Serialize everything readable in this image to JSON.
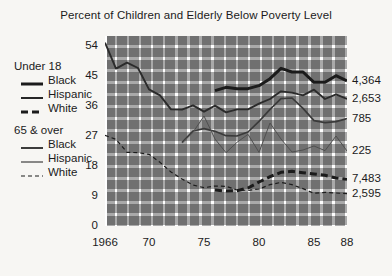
{
  "chart_data": {
    "type": "line",
    "title": "Percent of Children and Elderly Below Poverty Level",
    "xlabel": "",
    "ylabel": "",
    "xlim": [
      1966,
      1988
    ],
    "ylim": [
      0,
      57
    ],
    "yticks": [
      "0",
      "9",
      "18",
      "27",
      "36",
      "45",
      "54"
    ],
    "ytick_values": [
      0,
      9,
      18,
      27,
      36,
      45,
      54
    ],
    "xticks": [
      "1966",
      "70",
      "75",
      "80",
      "85",
      "88"
    ],
    "xtick_values": [
      1966,
      1970,
      1975,
      1980,
      1985,
      1988
    ],
    "grid": true,
    "grid_style": "checkered-gray-blocks",
    "legend_position": "left-outside",
    "series": [
      {
        "name": "Under 18 Black",
        "group": "Under 18",
        "race": "Black",
        "style": "thick-solid",
        "color": "#1b1b1b",
        "end_label": "4,364",
        "x": [
          1976,
          1977,
          1978,
          1979,
          1980,
          1981,
          1982,
          1983,
          1984,
          1985,
          1986,
          1987,
          1988
        ],
        "values": [
          40.6,
          41.6,
          41.2,
          41.2,
          42.1,
          44.2,
          47.3,
          46.2,
          46.2,
          43.1,
          43.1,
          45.1,
          43.5
        ]
      },
      {
        "name": "Under 18 Hispanic",
        "group": "Under 18",
        "race": "Hispanic",
        "style": "medium-solid",
        "color": "#2b2b2b",
        "end_label": "2,653",
        "x": [
          1966,
          1967,
          1968,
          1969,
          1970,
          1971,
          1972,
          1973,
          1974,
          1975,
          1976,
          1977,
          1978,
          1979,
          1980,
          1981,
          1982,
          1983,
          1984,
          1985,
          1986,
          1987,
          1988
        ],
        "values": [
          55.0,
          47.2,
          49.0,
          47.4,
          41.0,
          39.2,
          35.0,
          34.9,
          36.2,
          34.3,
          36.1,
          34.1,
          35.0,
          35.0,
          36.7,
          38.1,
          40.4,
          40.0,
          39.2,
          40.9,
          38.1,
          39.5,
          38.1
        ]
      },
      {
        "name": "Under 18 White",
        "group": "Under 18",
        "race": "White",
        "style": "thick-dashed",
        "color": "#1b1b1b",
        "end_label": "7,483",
        "x": [
          1976,
          1977,
          1978,
          1979,
          1980,
          1981,
          1982,
          1983,
          1984,
          1985,
          1986,
          1987,
          1988
        ],
        "values": [
          10.8,
          10.5,
          10.6,
          11.4,
          13.2,
          14.8,
          16.1,
          16.4,
          16.0,
          15.6,
          15.2,
          14.4,
          14.0
        ]
      },
      {
        "name": "65 & over Black",
        "group": "65 & over",
        "race": "Black",
        "style": "thin-solid-dark",
        "color": "#3a3a3a",
        "end_label": "785",
        "x": [
          1973,
          1974,
          1975,
          1976,
          1977,
          1978,
          1979,
          1980,
          1981,
          1982,
          1983,
          1984,
          1985,
          1986,
          1987,
          1988
        ],
        "values": [
          25.0,
          28.5,
          29.2,
          28.4,
          27.1,
          27.0,
          28.2,
          31.4,
          35.0,
          38.2,
          38.4,
          35.3,
          31.6,
          31.0,
          31.3,
          32.2
        ]
      },
      {
        "name": "65 & over Hispanic",
        "group": "65 & over",
        "race": "Hispanic",
        "style": "thin-solid",
        "color": "#4f4f4f",
        "end_label": "225",
        "x": [
          1973,
          1974,
          1975,
          1976,
          1977,
          1978,
          1979,
          1980,
          1981,
          1982,
          1983,
          1984,
          1985,
          1986,
          1987,
          1988
        ],
        "values": [
          24.9,
          28.1,
          33.0,
          26.1,
          22.0,
          25.1,
          27.5,
          22.1,
          30.9,
          26.1,
          22.2,
          22.8,
          24.0,
          22.6,
          27.0,
          22.5
        ]
      },
      {
        "name": "65 & over White",
        "group": "65 & over",
        "race": "White",
        "style": "thin-dashed",
        "color": "#1b1b1b",
        "end_label": "2,595",
        "x": [
          1966,
          1967,
          1968,
          1969,
          1970,
          1971,
          1972,
          1973,
          1974,
          1975,
          1976,
          1977,
          1978,
          1979,
          1980,
          1981,
          1982,
          1983,
          1984,
          1985,
          1986,
          1987,
          1988
        ],
        "values": [
          27.2,
          26.0,
          22.1,
          22.0,
          21.5,
          19.1,
          16.2,
          14.1,
          12.3,
          11.5,
          12.0,
          11.9,
          10.8,
          10.7,
          11.1,
          12.4,
          13.1,
          12.4,
          11.2,
          9.8,
          10.1,
          9.9,
          9.7
        ]
      }
    ]
  },
  "title": "Percent of Children and Elderly Below Poverty Level",
  "legend": {
    "groups": [
      {
        "title": "Under 18",
        "items": [
          {
            "label": "Black",
            "style": "thick-solid"
          },
          {
            "label": "Hispanic",
            "style": "medium-solid"
          },
          {
            "label": "White",
            "style": "thick-dashed"
          }
        ]
      },
      {
        "title": "65 & over",
        "items": [
          {
            "label": "Black",
            "style": "thin-solid-dark"
          },
          {
            "label": "Hispanic",
            "style": "thin-solid"
          },
          {
            "label": "White",
            "style": "thin-dashed"
          }
        ]
      }
    ]
  },
  "colors": {
    "background": "#f7f6f3",
    "grid_block": "#a9a9a9",
    "grid_gap": "#ffffff",
    "ink": "#1b1b1b"
  }
}
